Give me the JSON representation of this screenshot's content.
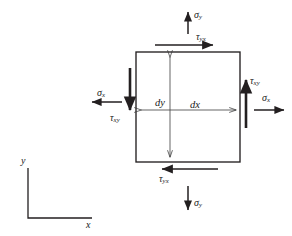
{
  "figure": {
    "canvas": {
      "width": 292,
      "height": 236,
      "background": "#ffffff"
    },
    "line_color": "#231f20",
    "element": {
      "name": "stress-element-square",
      "x": 136,
      "y": 52,
      "width": 104,
      "height": 110
    }
  },
  "dimensions": {
    "dx": {
      "label": "dx",
      "symbol": "d",
      "subscript": "",
      "text": "dx"
    },
    "dy": {
      "label": "dy",
      "symbol": "d",
      "subscript": "",
      "text": "dy"
    }
  },
  "stresses": {
    "sigma_y_top": {
      "symbol": "σ",
      "subscript": "y",
      "direction": "up",
      "face": "top"
    },
    "tau_yx_top": {
      "symbol": "τ",
      "subscript": "yx",
      "direction": "right",
      "face": "top"
    },
    "sigma_y_bottom": {
      "symbol": "σ",
      "subscript": "y",
      "direction": "down",
      "face": "bottom"
    },
    "tau_yx_bottom": {
      "symbol": "τ",
      "subscript": "yx",
      "direction": "left",
      "face": "bottom"
    },
    "sigma_x_left": {
      "symbol": "σ",
      "subscript": "x",
      "direction": "left",
      "face": "left"
    },
    "tau_xy_left": {
      "symbol": "τ",
      "subscript": "xy",
      "direction": "down",
      "face": "left"
    },
    "sigma_x_right": {
      "symbol": "σ",
      "subscript": "x",
      "direction": "right",
      "face": "right"
    },
    "tau_xy_right": {
      "symbol": "τ",
      "subscript": "xy",
      "direction": "up",
      "face": "right"
    }
  },
  "axes": {
    "y_label": "y",
    "x_label": "x",
    "origin_x": 28,
    "origin_y": 218
  }
}
